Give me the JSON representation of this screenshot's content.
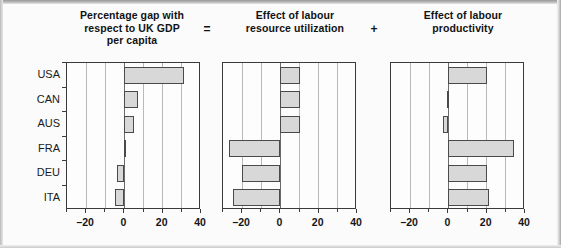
{
  "figure": {
    "background_color": "#fbfbfb",
    "bar_fill_color": "#d8d8d8",
    "bar_edge_color": "#4a4a4a",
    "axis_color": "#3a3a3a",
    "grid_color": "#b9b9b9",
    "operators": [
      "=",
      "+"
    ]
  },
  "chart_data": {
    "type": "bar",
    "orientation": "horizontal",
    "title": "",
    "categories": [
      "USA",
      "CAN",
      "AUS",
      "FRA",
      "DEU",
      "ITA"
    ],
    "xlabel": "",
    "ylabel": "",
    "xlim": [
      -30,
      40
    ],
    "xticks": [
      -20,
      0,
      20,
      40
    ],
    "xticklabels": [
      "–20",
      "0",
      "20",
      "40"
    ],
    "gridlines": [
      -30,
      -20,
      -10,
      0,
      10,
      20,
      30,
      40
    ],
    "grid": true,
    "legend": "none",
    "panels": [
      {
        "index": 0,
        "title": "Percentage gap with\nrespect to UK GDP\nper capita",
        "title_lines": [
          "Percentage gap with",
          "respect to UK GDP",
          "per capita"
        ],
        "operator_after": "=",
        "values": [
          31,
          7,
          5,
          0.5,
          -4,
          -5
        ]
      },
      {
        "index": 1,
        "title": "Effect of labour\nresource utilization",
        "title_lines": [
          "Effect of labour",
          "resource utilization"
        ],
        "operator_after": "+",
        "values": [
          10,
          10,
          10,
          -27,
          -20,
          -25
        ]
      },
      {
        "index": 2,
        "title": "Effect of labour\nproductivity",
        "title_lines": [
          "Effect of labour",
          "productivity"
        ],
        "operator_after": "",
        "values": [
          20,
          -1,
          -3,
          34,
          20,
          21
        ]
      }
    ]
  }
}
